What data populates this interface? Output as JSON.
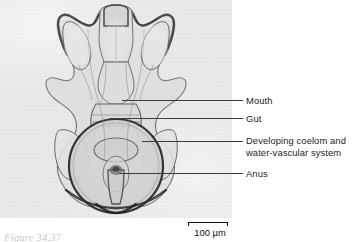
{
  "figure": {
    "kind": "light-micrograph-with-labels",
    "specimen": "sea star bipinnaria larva, ventral view",
    "micrograph_background": "#ececeb",
    "line_color": "#3c3c3c",
    "text_color": "#1d1d1d"
  },
  "labels": [
    {
      "id": "mouth",
      "text": "Mouth",
      "line2": ""
    },
    {
      "id": "gut",
      "text": "Gut",
      "line2": ""
    },
    {
      "id": "coelom",
      "text": "Developing coelom and",
      "line2": "water-vascular system"
    },
    {
      "id": "anus",
      "text": "Anus",
      "line2": ""
    }
  ],
  "scale": {
    "value": "100 µm",
    "bar_length_px": 40
  },
  "caption": {
    "text": "Figure  34.37"
  }
}
